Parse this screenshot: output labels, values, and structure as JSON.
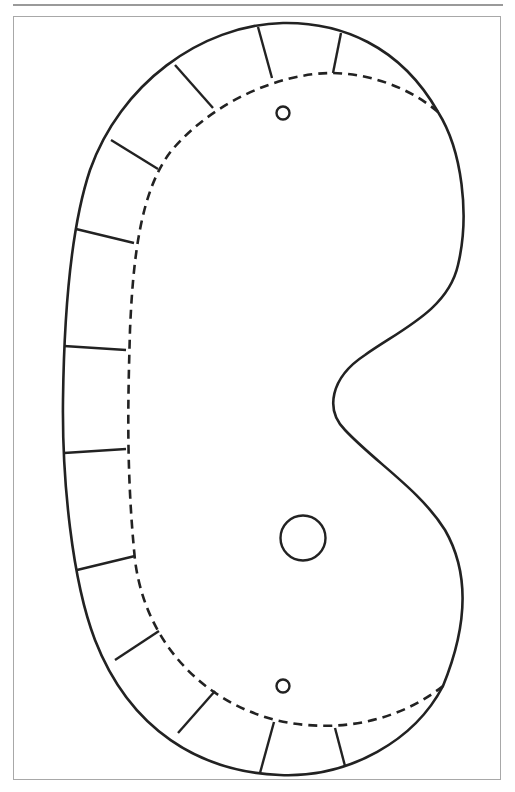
{
  "diagram": {
    "title": "",
    "colors": {
      "line": "#222222",
      "frame": "#a8a8a8",
      "background": "#ffffff"
    },
    "elements": {
      "outline": "solid cut line",
      "fold_line": "dashed fold line",
      "tab_count": 12,
      "small_holes": 2,
      "large_holes": 1
    }
  }
}
